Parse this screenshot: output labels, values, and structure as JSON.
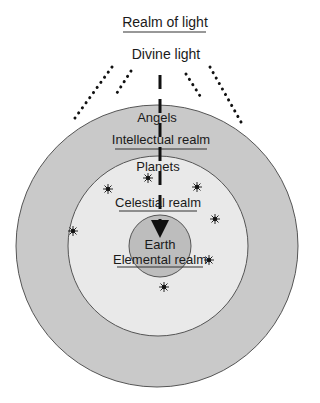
{
  "title": "Realm of light",
  "source_label": "Divine light",
  "rings": [
    {
      "name": "Intellectual realm",
      "inhabitants": "Angels",
      "color": "#c9c9c9",
      "cx": 157,
      "cy": 246,
      "r": 141
    },
    {
      "name": "Celestial realm",
      "inhabitants": "Planets",
      "color": "#e9e9e9",
      "cx": 158,
      "cy": 246,
      "r": 90
    },
    {
      "name": "Elemental realm",
      "inhabitants": "Earth",
      "color": "#bdbdbd",
      "cx": 160,
      "cy": 246,
      "r": 31
    }
  ],
  "labels": {
    "angels": "Angels",
    "intellectual": "Intellectual realm",
    "planets": "Planets",
    "celestial": "Celestial realm",
    "earth": "Earth",
    "elemental": "Elemental realm"
  },
  "stars": [
    {
      "x": 148,
      "y": 178
    },
    {
      "x": 108,
      "y": 189
    },
    {
      "x": 197,
      "y": 187
    },
    {
      "x": 215,
      "y": 219
    },
    {
      "x": 73,
      "y": 231
    },
    {
      "x": 209,
      "y": 260
    },
    {
      "x": 164,
      "y": 287
    }
  ],
  "light_rays": [
    {
      "x1": 112,
      "y1": 67,
      "x2": 75,
      "y2": 118
    },
    {
      "x1": 131,
      "y1": 71,
      "x2": 115,
      "y2": 96
    },
    {
      "x1": 186,
      "y1": 74,
      "x2": 202,
      "y2": 99
    },
    {
      "x1": 210,
      "y1": 67,
      "x2": 241,
      "y2": 122
    }
  ],
  "colors": {
    "line": "#555555",
    "text": "#1a1a1a",
    "arrow": "#111111"
  }
}
